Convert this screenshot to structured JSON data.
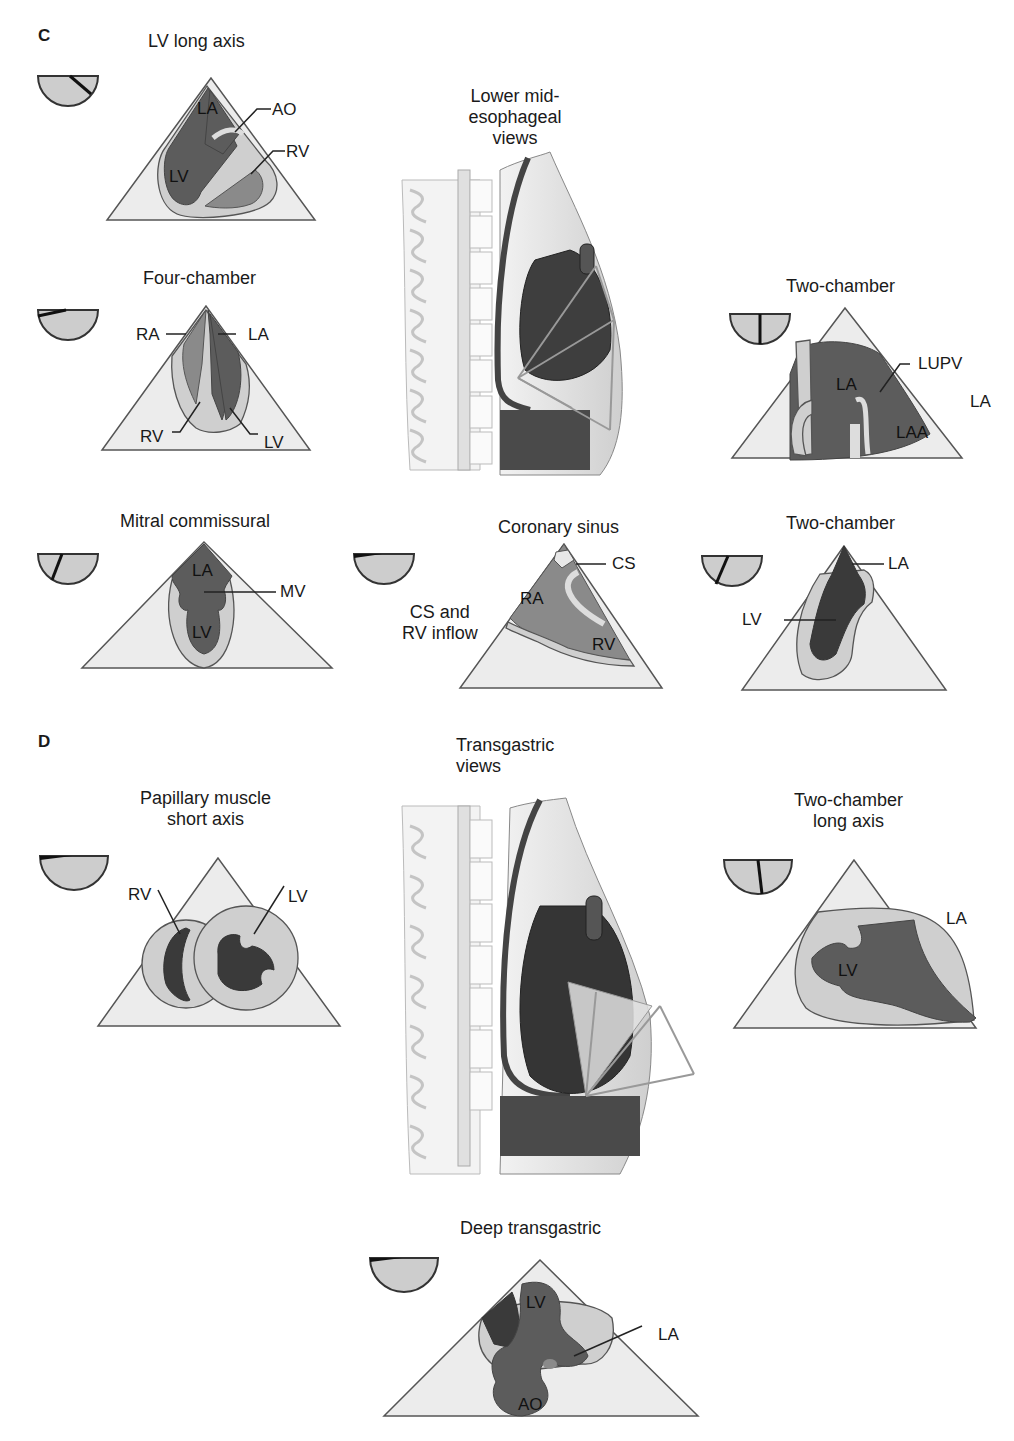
{
  "figure": {
    "sections": [
      {
        "letter": "C",
        "group_title": "Lower mid-\nesophageal\nviews",
        "group_title_lines": [
          "Lower mid-",
          "esophageal",
          "views"
        ],
        "views": [
          {
            "id": "lv-long-axis",
            "title": "LV long axis",
            "omniplane_angle_deg": 130,
            "labels": [
              "LA",
              "LV",
              "AO",
              "RV"
            ]
          },
          {
            "id": "four-chamber",
            "title": "Four-chamber",
            "omniplane_angle_deg": 10,
            "labels": [
              "RA",
              "LA",
              "RV",
              "LV"
            ]
          },
          {
            "id": "two-chamber-me",
            "title": "Two-chamber",
            "omniplane_angle_deg": 90,
            "labels": [
              "LA",
              "LUPV",
              "LAA"
            ],
            "side_label": "LA"
          },
          {
            "id": "mitral-commissural",
            "title": "Mitral commissural",
            "omniplane_angle_deg": 60,
            "labels": [
              "LA",
              "MV",
              "LV"
            ]
          },
          {
            "id": "coronary-sinus",
            "title": "Coronary sinus",
            "omniplane_angle_deg": 0,
            "labels": [
              "CS",
              "RA",
              "RV"
            ],
            "side_label": "CS and\nRV inflow",
            "side_label_lines": [
              "CS and",
              "RV inflow"
            ]
          },
          {
            "id": "two-chamber-me-2",
            "title": "Two-chamber",
            "omniplane_angle_deg": 60,
            "labels": [
              "LA",
              "LV"
            ]
          }
        ]
      },
      {
        "letter": "D",
        "group_title_lines": [
          "Transgastric",
          "views"
        ],
        "views": [
          {
            "id": "papillary-muscle-short-axis",
            "title_lines": [
              "Papillary muscle",
              "short axis"
            ],
            "omniplane_angle_deg": 0,
            "labels": [
              "RV",
              "LV"
            ]
          },
          {
            "id": "two-chamber-long-axis",
            "title_lines": [
              "Two-chamber",
              "long axis"
            ],
            "omniplane_angle_deg": 90,
            "labels": [
              "LV"
            ],
            "side_label": "LA"
          },
          {
            "id": "deep-transgastric",
            "title": "Deep transgastric",
            "omniplane_angle_deg": 0,
            "labels": [
              "LV",
              "LA",
              "AO"
            ]
          }
        ]
      }
    ]
  },
  "text": {
    "c_letter": "C",
    "d_letter": "D",
    "lv_long_title": "LV long axis",
    "lv_long": {
      "la": "LA",
      "lv": "LV",
      "ao": "AO",
      "rv": "RV"
    },
    "four_title": "Four-chamber",
    "four": {
      "ra": "RA",
      "la": "LA",
      "rv": "RV",
      "lv": "LV"
    },
    "me_group_1": "Lower mid-",
    "me_group_2": "esophageal",
    "me_group_3": "views",
    "two_me_title": "Two-chamber",
    "two_me": {
      "la": "LA",
      "lupv": "LUPV",
      "laa": "LAA",
      "side_la": "LA"
    },
    "mitral_title": "Mitral commissural",
    "mitral": {
      "la": "LA",
      "mv": "MV",
      "lv": "LV"
    },
    "cs_title": "Coronary sinus",
    "cs": {
      "cs": "CS",
      "ra": "RA",
      "rv": "RV",
      "side_1": "CS and",
      "side_2": "RV inflow"
    },
    "two_me2_title": "Two-chamber",
    "two_me2": {
      "la": "LA",
      "lv": "LV"
    },
    "tg_group_1": "Transgastric",
    "tg_group_2": "views",
    "pap_title_1": "Papillary muscle",
    "pap_title_2": "short axis",
    "pap": {
      "rv": "RV",
      "lv": "LV"
    },
    "tg2_title_1": "Two-chamber",
    "tg2_title_2": "long axis",
    "tg2": {
      "lv": "LV",
      "side_la": "LA"
    },
    "deep_title": "Deep transgastric",
    "deep": {
      "lv": "LV",
      "la": "LA",
      "ao": "AO"
    }
  },
  "colors": {
    "sector_fill": "#ececec",
    "myocardium": "#cfcfcf",
    "chamber_dark": "#5c5c5c",
    "chamber_darker": "#3a3a3a",
    "outline": "#555555"
  }
}
